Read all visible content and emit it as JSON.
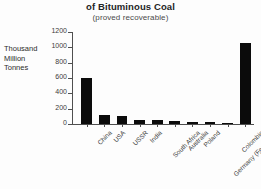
{
  "title": {
    "line1": "World Reserves",
    "line2": "of Bituminous Coal",
    "subtitle": "(proved recoverable)"
  },
  "axis": {
    "y_title_line1": "Thousand",
    "y_title_line2": "Million",
    "y_title_line3": "Tonnes"
  },
  "chart_data": {
    "type": "bar",
    "title": "World Reserves of Bituminous Coal",
    "subtitle": "(proved recoverable)",
    "xlabel": "",
    "ylabel": "Thousand Million Tonnes",
    "ylim": [
      0,
      1200
    ],
    "yticks": [
      0,
      200,
      400,
      600,
      800,
      1000,
      1200
    ],
    "grid": false,
    "legend": false,
    "bar_color": "#0b0b0b",
    "categories": [
      "China",
      "USA",
      "USSR",
      "India",
      "South Africa",
      "Australia",
      "Poland",
      "Germany (Fed. Rep.)",
      "Colombia",
      "World Total"
    ],
    "values": [
      600,
      115,
      110,
      55,
      50,
      45,
      30,
      25,
      15,
      1060
    ]
  }
}
